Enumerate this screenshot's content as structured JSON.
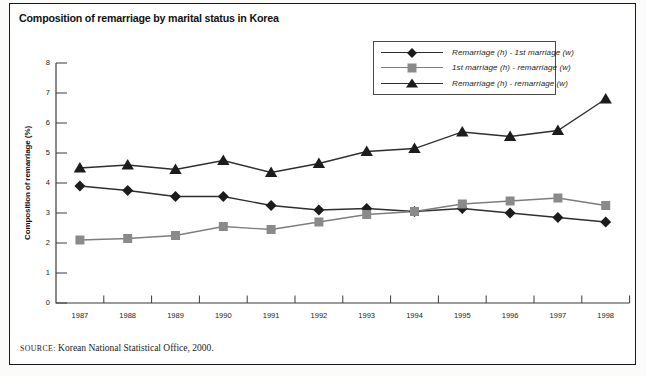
{
  "title": "Composition of remarriage by marital status in Korea",
  "source": {
    "prefix": "SOURCE:",
    "text": "Korean National Statistical Office, 2000."
  },
  "chart_data": {
    "type": "line",
    "title": "Composition of remarriage by marital status in Korea",
    "xlabel": "",
    "ylabel": "Composition of remarriage (%)",
    "x": [
      1987,
      1988,
      1989,
      1990,
      1991,
      1992,
      1993,
      1994,
      1995,
      1996,
      1997,
      1998
    ],
    "ylim": [
      0,
      8
    ],
    "yticks": [
      0,
      1,
      2,
      3,
      4,
      5,
      6,
      7,
      8
    ],
    "grid": false,
    "legend_position": "top-right-box",
    "series": [
      {
        "name": "Remarriage (h) - 1st marriage (w)",
        "marker": "diamond",
        "color": "#1c1c1c",
        "line_color": "#2e2e2e",
        "values": [
          3.9,
          3.75,
          3.55,
          3.55,
          3.25,
          3.1,
          3.15,
          3.05,
          3.15,
          3.0,
          2.85,
          2.7
        ]
      },
      {
        "name": "1st marriage (h) - remarriage (w)",
        "marker": "square",
        "color": "#8a8a8a",
        "line_color": "#7d7d7d",
        "values": [
          2.1,
          2.15,
          2.25,
          2.55,
          2.45,
          2.7,
          2.95,
          3.05,
          3.3,
          3.4,
          3.5,
          3.25
        ]
      },
      {
        "name": "Remarriage (h) - remarriage (w)",
        "marker": "triangle",
        "color": "#1c1c1c",
        "line_color": "#2e2e2e",
        "values": [
          4.5,
          4.6,
          4.45,
          4.75,
          4.35,
          4.65,
          5.05,
          5.15,
          5.7,
          5.55,
          5.75,
          6.8
        ]
      }
    ]
  }
}
